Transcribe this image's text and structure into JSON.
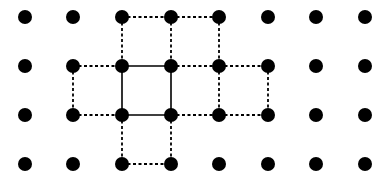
{
  "diagram": {
    "type": "dot-grid-figure",
    "grid": {
      "columns": 8,
      "rows": 4,
      "col_x": [
        25,
        73,
        122,
        171,
        219,
        268,
        316,
        365
      ],
      "row_y": [
        17,
        66,
        115,
        164
      ],
      "dot_radius": 7,
      "dot_color": "#000000"
    },
    "solid_square": {
      "description": "center square drawn with solid lines",
      "corners": [
        [
          2,
          1
        ],
        [
          3,
          1
        ],
        [
          3,
          2
        ],
        [
          2,
          2
        ]
      ],
      "color": "#000000"
    },
    "dashed_edges": [
      [
        [
          2,
          0
        ],
        [
          3,
          0
        ]
      ],
      [
        [
          3,
          0
        ],
        [
          4,
          0
        ]
      ],
      [
        [
          2,
          0
        ],
        [
          2,
          1
        ]
      ],
      [
        [
          3,
          0
        ],
        [
          3,
          1
        ]
      ],
      [
        [
          4,
          0
        ],
        [
          4,
          1
        ]
      ],
      [
        [
          1,
          1
        ],
        [
          2,
          1
        ]
      ],
      [
        [
          3,
          1
        ],
        [
          4,
          1
        ]
      ],
      [
        [
          4,
          1
        ],
        [
          5,
          1
        ]
      ],
      [
        [
          1,
          1
        ],
        [
          1,
          2
        ]
      ],
      [
        [
          4,
          1
        ],
        [
          4,
          2
        ]
      ],
      [
        [
          5,
          1
        ],
        [
          5,
          2
        ]
      ],
      [
        [
          1,
          2
        ],
        [
          2,
          2
        ]
      ],
      [
        [
          3,
          2
        ],
        [
          4,
          2
        ]
      ],
      [
        [
          4,
          2
        ],
        [
          5,
          2
        ]
      ],
      [
        [
          2,
          2
        ],
        [
          2,
          3
        ]
      ],
      [
        [
          3,
          2
        ],
        [
          3,
          3
        ]
      ],
      [
        [
          2,
          3
        ],
        [
          3,
          3
        ]
      ]
    ],
    "line_color": "#000000"
  }
}
